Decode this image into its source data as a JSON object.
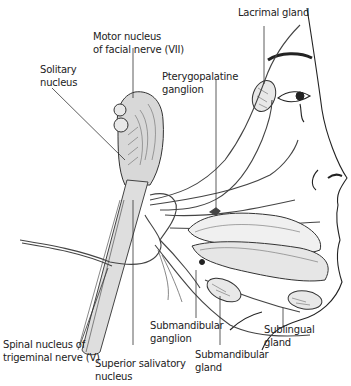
{
  "figure": {
    "type": "anatomical-diagram",
    "colors": {
      "line": "#333333",
      "fill_gray": "#dedede",
      "background": "#ffffff"
    }
  },
  "labels": {
    "lacrimal_gland": "Lacrimal gland",
    "motor_nucleus": "Motor nucleus\nof facial nerve (VII)",
    "solitary_nucleus": "Solitary\nnucleus",
    "pterygopalatine_ganglion": "Pterygopalatine\nganglion",
    "spinal_nucleus": "Spinal nucleus of\ntrigeminal nerve (V)",
    "superior_salivatory_nucleus": "Superior salivatory\nnucleus",
    "submandibular_ganglion": "Submandibular\nganglion",
    "submandibular_gland": "Submandibular\ngland",
    "sublingual_gland": "Sublingual\ngland"
  }
}
